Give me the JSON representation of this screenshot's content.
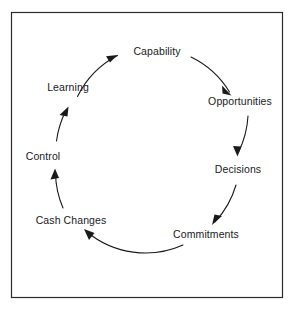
{
  "figure": {
    "type": "cycle-diagram",
    "title": "",
    "border_color": "#2b2b2b",
    "background_color": "#ffffff",
    "line_color": "#1a1a1a",
    "text_color": "#1a1a1a"
  },
  "frame": {
    "x": 11,
    "y": 12,
    "width": 272,
    "height": 286
  },
  "cycle": {
    "center_x": 147,
    "center_y": 157,
    "radius": 92,
    "direction": "clockwise",
    "node_count": 6,
    "nodes": [
      {
        "id": "capability",
        "label": "Capability",
        "angle_deg": 270,
        "x": 157,
        "y": 52
      },
      {
        "id": "opportunities",
        "label": "Opportunities",
        "angle_deg": 330,
        "x": 240,
        "y": 102
      },
      {
        "id": "decisions",
        "label": "Decisions",
        "angle_deg": 30,
        "x": 238,
        "y": 170
      },
      {
        "id": "commitments",
        "label": "Commitments",
        "angle_deg": 75,
        "x": 206,
        "y": 235
      },
      {
        "id": "cash-changes",
        "label": "Cash Changes",
        "angle_deg": 130,
        "x": 71,
        "y": 221
      },
      {
        "id": "control",
        "label": "Control",
        "angle_deg": 185,
        "x": 43,
        "y": 157
      },
      {
        "id": "learning",
        "label": "Learning",
        "angle_deg": 225,
        "x": 68,
        "y": 88
      }
    ],
    "edges": [
      {
        "id": "learning-to-capability",
        "from": "Learning",
        "to": "Capability"
      },
      {
        "id": "capability-to-opportunities",
        "from": "Capability",
        "to": "Opportunities"
      },
      {
        "id": "opportunities-to-decisions",
        "from": "Opportunities",
        "to": "Decisions"
      },
      {
        "id": "decisions-to-commitments",
        "from": "Decisions",
        "to": "Commitments"
      },
      {
        "id": "commitments-to-cash-changes",
        "from": "Commitments",
        "to": "Cash Changes"
      },
      {
        "id": "cash-changes-to-control",
        "from": "Cash Changes",
        "to": "Control"
      },
      {
        "id": "control-to-learning",
        "from": "Control",
        "to": "Learning"
      }
    ]
  }
}
